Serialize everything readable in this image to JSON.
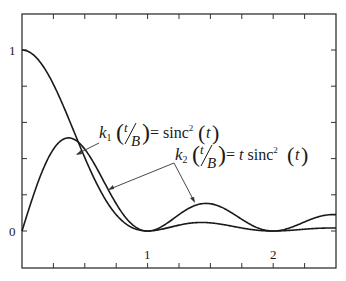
{
  "chart_data": {
    "type": "line",
    "title": "",
    "xlabel": "",
    "ylabel": "",
    "xlim": [
      0,
      2.5
    ],
    "ylim": [
      -0.2,
      1.2
    ],
    "grid": false,
    "legend": "none (inline annotations with arrows)",
    "x_ticks": [
      0.25,
      0.5,
      0.75,
      1,
      1.25,
      1.5,
      1.75,
      2,
      2.25
    ],
    "x_tick_labels": [
      {
        "value": 1,
        "label": "1"
      },
      {
        "value": 2,
        "label": "2"
      }
    ],
    "y_ticks": [
      0,
      0.2,
      0.4,
      0.6,
      0.8,
      1
    ],
    "y_tick_labels": [
      {
        "value": 0,
        "label": "0"
      },
      {
        "value": 1,
        "label": "1"
      }
    ],
    "series": [
      {
        "name": "k1(t/B) = sinc^2(t)",
        "formula": "sinc^2(t)",
        "x": [
          0,
          0.25,
          0.5,
          0.75,
          1,
          1.25,
          1.5,
          1.75,
          2,
          2.25,
          2.5
        ],
        "values": [
          1.0,
          0.811,
          0.405,
          0.09,
          0.0,
          0.032,
          0.045,
          0.017,
          0.0,
          0.01,
          0.016
        ]
      },
      {
        "name": "k2(t/B) = t sinc^2(t)",
        "formula": "t*sinc^2(t)",
        "x": [
          0,
          0.25,
          0.5,
          0.75,
          1,
          1.25,
          1.5,
          1.75,
          2,
          2.25,
          2.5
        ],
        "values": [
          0.0,
          0.203,
          0.203,
          0.068,
          0.0,
          0.041,
          0.068,
          0.029,
          0.0,
          0.022,
          0.041
        ]
      }
    ],
    "annotations": [
      {
        "text": "k1(t/B) = sinc^2(t)",
        "target_series": "k1(t/B) = sinc^2(t)"
      },
      {
        "text": "k2(t/B) = t sinc^2(t)",
        "target_series": "k2(t/B) = t sinc^2(t)"
      }
    ]
  },
  "labels": {
    "y_zero": "0",
    "y_one": "1",
    "x_one": "1",
    "x_two": "2",
    "k1": {
      "k": "k",
      "sub": "1",
      "num": "t",
      "den": "B",
      "eq": "= sinc",
      "sup": "2",
      "arg": "t"
    },
    "k2": {
      "k": "k",
      "sub": "2",
      "num": "t",
      "den": "B",
      "eq": "= ",
      "t": "t",
      "sinc": " sinc",
      "sup": "2",
      "arg": "t"
    }
  },
  "colors": {
    "line": "#1a1a1a",
    "axis": "#333333",
    "background": "#ffffff"
  }
}
